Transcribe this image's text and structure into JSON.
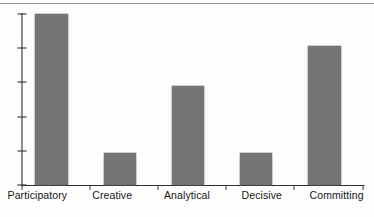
{
  "chart_data": {
    "type": "bar",
    "title": "",
    "xlabel": "",
    "ylabel": "",
    "categories": [
      "Participatory",
      "Creative",
      "Analytical",
      "Decisive",
      "Committing"
    ],
    "values": [
      100,
      19,
      58,
      19,
      81
    ],
    "ylim": [
      0,
      100
    ],
    "grid": false,
    "legend": null,
    "y_tick_count": 5,
    "bar_color": "#757575",
    "axis_color": "#2e2e30"
  },
  "axis": {
    "y_ticks": [
      0,
      20,
      40,
      60,
      80,
      100
    ],
    "x_tick_marks": 6
  },
  "labels": {
    "cat_0": "Participatory",
    "cat_1": "Creative",
    "cat_2": "Analytical",
    "cat_3": "Decisive",
    "cat_4": "Committing"
  },
  "colors": {
    "bar_fill": "#757575",
    "axis": "#2e2e30",
    "text": "#16161a",
    "page_rule": "#7b7b78",
    "background": "#fdfdfc"
  }
}
